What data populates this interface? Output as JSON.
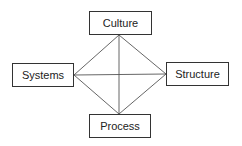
{
  "diagram": {
    "nodes": [
      {
        "id": "culture",
        "label": "Culture"
      },
      {
        "id": "systems",
        "label": "Systems"
      },
      {
        "id": "structure",
        "label": "Structure"
      },
      {
        "id": "process",
        "label": "Process"
      }
    ],
    "edges": [
      [
        "culture",
        "systems"
      ],
      [
        "culture",
        "structure"
      ],
      [
        "culture",
        "process"
      ],
      [
        "systems",
        "structure"
      ],
      [
        "systems",
        "process"
      ],
      [
        "structure",
        "process"
      ]
    ],
    "colors": {
      "line": "#555555",
      "border": "#333333",
      "text": "#222222"
    }
  }
}
